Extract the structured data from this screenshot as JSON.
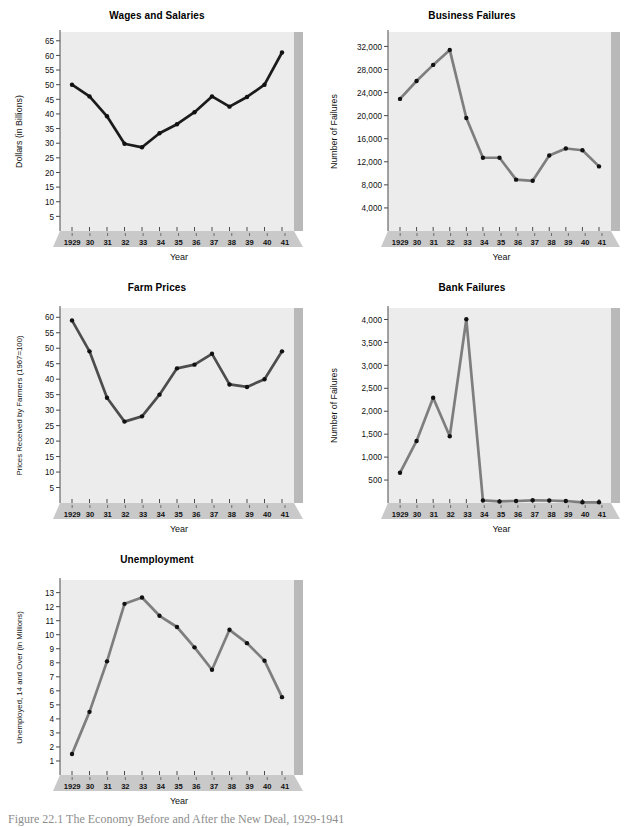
{
  "figure": {
    "caption": "Figure 22.1  The Economy Before and After the New Deal, 1929-1941",
    "xlabel": "Year",
    "years": [
      "1929",
      "30",
      "31",
      "32",
      "33",
      "34",
      "35",
      "36",
      "37",
      "38",
      "39",
      "40",
      "41"
    ],
    "colors": {
      "plot_face": "#ececec",
      "plot_side": "#b9b9b9",
      "plot_base": "#c9c9c9",
      "line_dark": "#1b1b1b",
      "line_gray": "#7e7e7e",
      "marker": "#111111",
      "axis": "#4a4a4a",
      "text": "#111111"
    }
  },
  "chart_data": [
    {
      "id": "wages-and-salaries",
      "type": "line",
      "title": "Wages and Salaries",
      "xlabel": "Year",
      "ylabel": "Dollars (in Billions)",
      "categories": [
        "1929",
        "30",
        "31",
        "32",
        "33",
        "34",
        "35",
        "36",
        "37",
        "38",
        "39",
        "40",
        "41"
      ],
      "values": [
        50.0,
        46.0,
        39.2,
        29.8,
        28.6,
        33.4,
        36.5,
        40.6,
        46.0,
        42.5,
        45.8,
        50.0,
        61.0
      ],
      "yticks": [
        5,
        10,
        15,
        20,
        25,
        30,
        35,
        40,
        45,
        50,
        55,
        60,
        65
      ],
      "ylim": [
        0,
        68
      ],
      "grid": false,
      "line_color": "#1b1b1b",
      "legend": "none"
    },
    {
      "id": "business-failures",
      "type": "line",
      "title": "Business Failures",
      "xlabel": "Year",
      "ylabel": "Number of Failures",
      "categories": [
        "1929",
        "30",
        "31",
        "32",
        "33",
        "34",
        "35",
        "36",
        "37",
        "38",
        "39",
        "40",
        "41"
      ],
      "values": [
        22900,
        26000,
        28800,
        31400,
        19600,
        12700,
        12700,
        8900,
        8700,
        13100,
        14300,
        14000,
        11200
      ],
      "yticks": [
        4000,
        8000,
        12000,
        16000,
        20000,
        24000,
        28000,
        32000
      ],
      "yticklabels": [
        "4,000",
        "8,000",
        "12,000",
        "16,000",
        "20,000",
        "24,000",
        "28,000",
        "32,000"
      ],
      "ylim": [
        0,
        34500
      ],
      "grid": false,
      "line_color": "#7e7e7e",
      "legend": "none"
    },
    {
      "id": "farm-prices",
      "type": "line",
      "title": "Farm Prices",
      "xlabel": "Year",
      "ylabel": "Prices Received by Farmers (1967=100)",
      "categories": [
        "1929",
        "30",
        "31",
        "32",
        "33",
        "34",
        "35",
        "36",
        "37",
        "38",
        "39",
        "40",
        "41"
      ],
      "values": [
        59.0,
        49.0,
        34.0,
        26.3,
        28.0,
        35.0,
        43.5,
        44.7,
        48.2,
        38.3,
        37.5,
        40.0,
        49.0
      ],
      "yticks": [
        5,
        10,
        15,
        20,
        25,
        30,
        35,
        40,
        45,
        50,
        55,
        60
      ],
      "ylim": [
        0,
        63
      ],
      "grid": false,
      "line_color": "#4d4d4d",
      "legend": "none"
    },
    {
      "id": "bank-failures",
      "type": "line",
      "title": "Bank Failures",
      "xlabel": "Year",
      "ylabel": "Number of Failures",
      "categories": [
        "1929",
        "30",
        "31",
        "32",
        "33",
        "34",
        "35",
        "36",
        "37",
        "38",
        "39",
        "40",
        "41"
      ],
      "values": [
        659,
        1352,
        2294,
        1456,
        4004,
        57,
        34,
        44,
        59,
        54,
        43,
        15,
        15
      ],
      "yticks": [
        500,
        1000,
        1500,
        2000,
        2500,
        3000,
        3500,
        4000
      ],
      "yticklabels": [
        "500",
        "1,000",
        "1,500",
        "2,000",
        "2,500",
        "3,000",
        "3,500",
        "4,000"
      ],
      "ylim": [
        0,
        4250
      ],
      "grid": false,
      "line_color": "#7e7e7e",
      "legend": "none"
    },
    {
      "id": "unemployment",
      "type": "line",
      "title": "Unemployment",
      "xlabel": "Year",
      "ylabel": "Unemployed, 14 and Over (in Millions)",
      "categories": [
        "1929",
        "30",
        "31",
        "32",
        "33",
        "34",
        "35",
        "36",
        "37",
        "38",
        "39",
        "40",
        "41"
      ],
      "values": [
        1.5,
        4.5,
        8.1,
        12.2,
        12.65,
        11.35,
        10.55,
        9.1,
        7.5,
        10.35,
        9.4,
        8.15,
        5.55
      ],
      "yticks": [
        1,
        2,
        3,
        4,
        5,
        6,
        7,
        8,
        9,
        10,
        11,
        12,
        13
      ],
      "ylim": [
        0,
        13.9
      ],
      "grid": false,
      "line_color": "#7e7e7e",
      "legend": "none"
    }
  ]
}
